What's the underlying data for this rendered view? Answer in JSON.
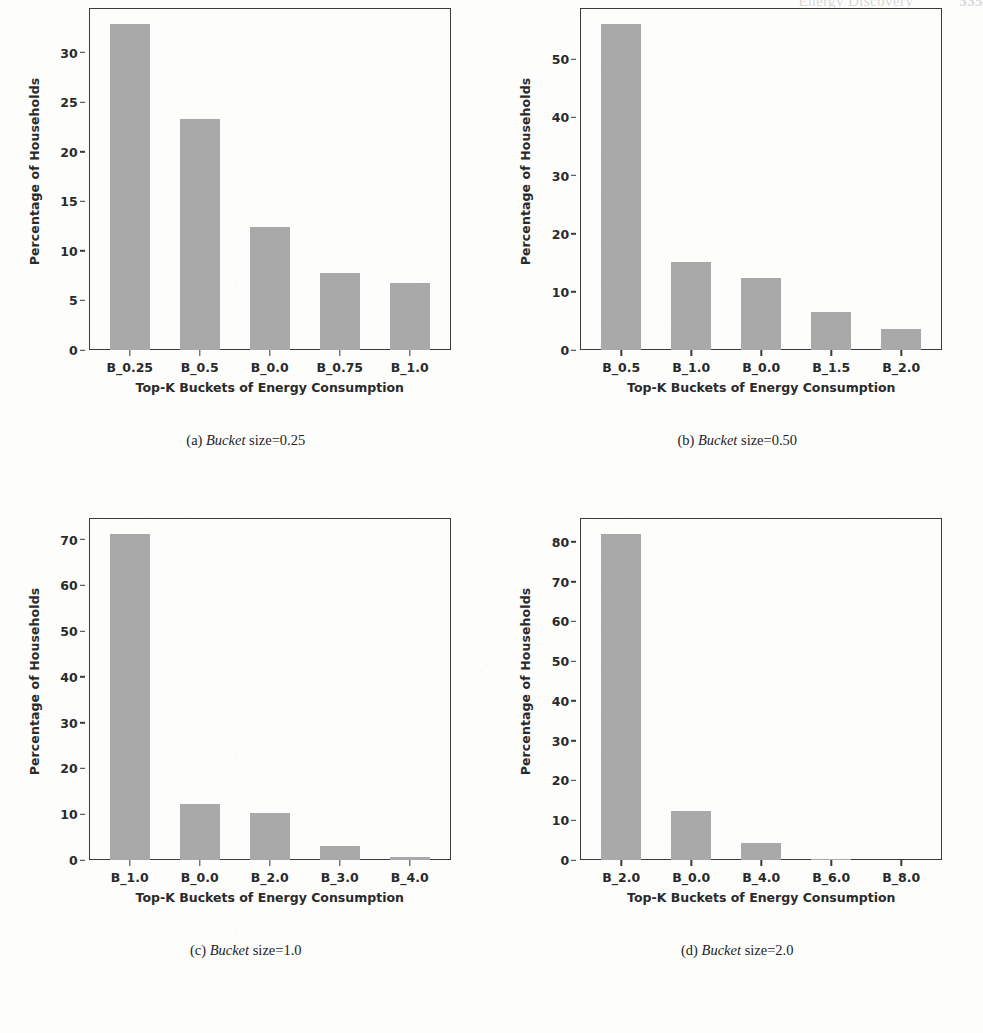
{
  "page": {
    "header_title": "Energy Discovery",
    "header_page": "335"
  },
  "figure": {
    "panels": [
      {
        "id": "panel-a",
        "caption_label": "(a)",
        "caption_italic": "Bucket",
        "caption_rest": "size=0.25",
        "caption_full": "(a) Bucket size=0.25",
        "chart_data": {
          "type": "bar",
          "title": "",
          "xlabel": "Top-K Buckets of Energy Consumption",
          "ylabel": "Percentage of Households",
          "categories": [
            "B_0.25",
            "B_0.5",
            "B_0.0",
            "B_0.75",
            "B_1.0"
          ],
          "values": [
            32.9,
            23.3,
            12.4,
            7.8,
            6.8
          ],
          "yticks": [
            0,
            5,
            10,
            15,
            20,
            25,
            30
          ],
          "ytick_labels": [
            "0",
            "5",
            "10",
            "15",
            "20",
            "25",
            "30"
          ],
          "ylim": [
            0,
            34.5
          ],
          "grid": false,
          "legend": null,
          "bar_color": "#a9a9a9"
        }
      },
      {
        "id": "panel-b",
        "caption_label": "(b)",
        "caption_italic": "Bucket",
        "caption_rest": "size=0.50",
        "caption_full": "(b) Bucket size=0.50",
        "chart_data": {
          "type": "bar",
          "title": "",
          "xlabel": "Top-K Buckets of Energy Consumption",
          "ylabel": "Percentage of Households",
          "categories": [
            "B_0.5",
            "B_1.0",
            "B_0.0",
            "B_1.5",
            "B_2.0"
          ],
          "values": [
            56.1,
            15.1,
            12.3,
            6.5,
            3.6
          ],
          "yticks": [
            0,
            10,
            20,
            30,
            40,
            50
          ],
          "ytick_labels": [
            "0",
            "10",
            "20",
            "30",
            "40",
            "50"
          ],
          "ylim": [
            0,
            58.8
          ],
          "grid": false,
          "legend": null,
          "bar_color": "#a9a9a9"
        }
      },
      {
        "id": "panel-c",
        "caption_label": "(c)",
        "caption_italic": "Bucket",
        "caption_rest": "size=1.0",
        "caption_full": "(c) Bucket size=1.0",
        "chart_data": {
          "type": "bar",
          "title": "",
          "xlabel": "Top-K Buckets of Energy Consumption",
          "ylabel": "Percentage of Households",
          "categories": [
            "B_1.0",
            "B_0.0",
            "B_2.0",
            "B_3.0",
            "B_4.0"
          ],
          "values": [
            71.2,
            12.3,
            10.3,
            3.0,
            0.7
          ],
          "yticks": [
            0,
            10,
            20,
            30,
            40,
            50,
            60,
            70
          ],
          "ytick_labels": [
            "0",
            "10",
            "20",
            "30",
            "40",
            "50",
            "60",
            "70"
          ],
          "ylim": [
            0,
            74.7
          ],
          "grid": false,
          "legend": null,
          "bar_color": "#a9a9a9"
        }
      },
      {
        "id": "panel-d",
        "caption_label": "(d)",
        "caption_italic": "Bucket",
        "caption_rest": "size=2.0",
        "caption_full": "(d) Bucket size=2.0",
        "chart_data": {
          "type": "bar",
          "title": "",
          "xlabel": "Top-K Buckets of Energy Consumption",
          "ylabel": "Percentage of Households",
          "categories": [
            "B_2.0",
            "B_0.0",
            "B_4.0",
            "B_6.0",
            "B_8.0"
          ],
          "values": [
            81.9,
            12.2,
            4.3,
            0.3,
            0.0
          ],
          "yticks": [
            0,
            10,
            20,
            30,
            40,
            50,
            60,
            70,
            80
          ],
          "ytick_labels": [
            "0",
            "10",
            "20",
            "30",
            "40",
            "50",
            "60",
            "70",
            "80"
          ],
          "ylim": [
            0,
            86.0
          ],
          "grid": false,
          "legend": null,
          "bar_color": "#a9a9a9"
        }
      }
    ]
  }
}
